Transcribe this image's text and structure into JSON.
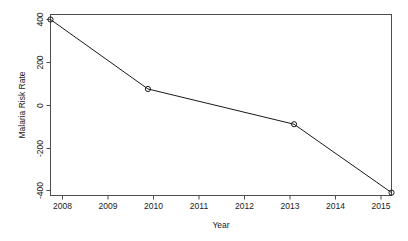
{
  "chart_data": {
    "type": "line",
    "title": "",
    "subtitle": "",
    "xlabel": "Year",
    "ylabel": "Malaria Risk Rate",
    "x": [
      2008,
      2010,
      2013,
      2015
    ],
    "values": [
      400,
      75,
      -90,
      -410
    ],
    "series": [
      {
        "name": "Malaria Risk Rate",
        "x": [
          2008,
          2010,
          2013,
          2015
        ],
        "values": [
          400,
          75,
          -90,
          -410
        ]
      }
    ],
    "xlim": [
      2008,
      2015
    ],
    "ylim": [
      -420,
      410
    ],
    "x_ticks": [
      2008,
      2009,
      2010,
      2011,
      2012,
      2013,
      2014,
      2015
    ],
    "x_tick_labels": [
      "2008",
      "2009",
      "2010",
      "2011",
      "2012",
      "2013",
      "2014",
      "2015"
    ],
    "y_ticks": [
      400,
      200,
      0,
      -200,
      -400
    ],
    "y_tick_labels": [
      "400",
      "200",
      "0",
      "-200",
      "-400"
    ],
    "grid": false,
    "legend": false,
    "legend_position": "none",
    "marker": "open-circle",
    "line_color": "#1a1a1a",
    "frame_color": "#4d4d4d",
    "background_color": "#ffffff"
  },
  "axes": {
    "x_title": "Year",
    "y_title": "Malaria Risk Rate",
    "x_labels": [
      "2008",
      "2009",
      "2010",
      "2011",
      "2012",
      "2013",
      "2014",
      "2015"
    ],
    "y_labels": [
      "400",
      "200",
      "0",
      "-200",
      "-400"
    ]
  }
}
